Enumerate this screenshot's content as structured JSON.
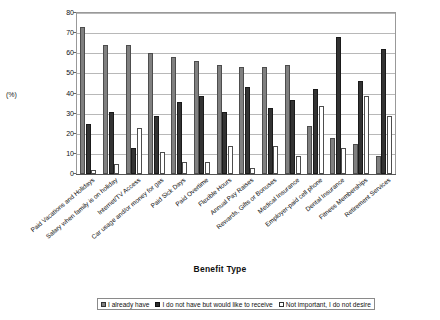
{
  "chart_data": {
    "type": "bar",
    "title": "",
    "xlabel": "Benefit Type",
    "ylabel": "(%)",
    "ylim": [
      0,
      80
    ],
    "ytick_step": 10,
    "yticks": [
      80,
      70,
      60,
      50,
      40,
      30,
      20,
      10,
      0
    ],
    "grid": true,
    "legend_position": "bottom",
    "categories": [
      "Paid Vacations and Holidays",
      "Salary when family is on holiday",
      "Internet/TV Access",
      "Car usage and/or money for gas",
      "Paid Sick Days",
      "Paid Overtime",
      "Flexible Hours",
      "Annual Pay Raises",
      "Rewards, Gifts or Bonuses",
      "Medical Insurance",
      "Employer-paid cell phone",
      "Dental Insurance",
      "Fitness Memberships",
      "Retirement Services"
    ],
    "series": [
      {
        "name": "I already have",
        "color": "#808080",
        "values": [
          73,
          64,
          64,
          60,
          58,
          56,
          54,
          53,
          53,
          54,
          24,
          18,
          15,
          9
        ]
      },
      {
        "name": "I do not have but would like to receive",
        "color": "#333333",
        "values": [
          25,
          31,
          13,
          29,
          36,
          39,
          31,
          43,
          33,
          37,
          42,
          68,
          46,
          62
        ]
      },
      {
        "name": "Not important, I do not desire",
        "color": "#ffffff",
        "values": [
          2,
          5,
          23,
          11,
          6,
          6,
          14,
          3,
          14,
          9,
          34,
          13,
          39,
          29
        ]
      }
    ]
  },
  "legend": {
    "items": [
      "I already have",
      "I do not have but would like to receive",
      "Not important, I do not desire"
    ]
  },
  "axes": {
    "y_title": "(%)",
    "x_title": "Benefit Type"
  }
}
